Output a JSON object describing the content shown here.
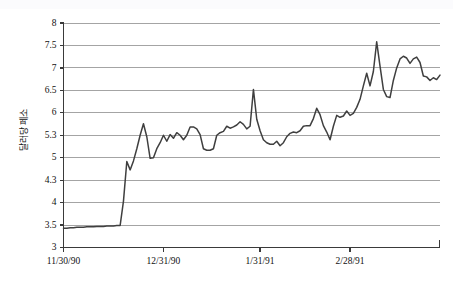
{
  "chart_data": {
    "type": "line",
    "title": "",
    "subtitle": "",
    "xlabel": "",
    "ylabel": "달러당 페소",
    "legend": [],
    "legend_position": "none",
    "grid": true,
    "grid_axis": "y",
    "ylim": [
      3,
      8
    ],
    "ytick_labels": [
      "3",
      "3.5",
      "4",
      "4.3",
      "5",
      "5.3",
      "6",
      "6.5",
      "7",
      "7.5",
      "8"
    ],
    "ytick_values": [
      3,
      3.5,
      4,
      4.3,
      5,
      5.3,
      6,
      6.5,
      7,
      7.5,
      8
    ],
    "xtick_labels": [
      "11/30/90",
      "12/31/90",
      "1/31/91",
      "2/28/91"
    ],
    "xtick_positions": [
      0,
      30,
      59,
      86
    ],
    "xlim": [
      0,
      113
    ],
    "series": [
      {
        "name": "달러당 페소",
        "color": "#3f3f3f",
        "x": [
          0,
          1,
          2,
          3,
          4,
          5,
          6,
          7,
          8,
          9,
          10,
          11,
          12,
          13,
          14,
          15,
          16,
          17,
          18,
          19,
          20,
          21,
          22,
          23,
          24,
          25,
          26,
          27,
          28,
          29,
          30,
          31,
          32,
          33,
          34,
          35,
          36,
          37,
          38,
          39,
          40,
          41,
          42,
          43,
          44,
          45,
          46,
          47,
          48,
          49,
          50,
          51,
          52,
          53,
          54,
          55,
          56,
          57,
          58,
          59,
          60,
          61,
          62,
          63,
          64,
          65,
          66,
          67,
          68,
          69,
          70,
          71,
          72,
          73,
          74,
          75,
          76,
          77,
          78,
          79,
          80,
          81,
          82,
          83,
          84,
          85,
          86,
          87,
          88,
          89,
          90,
          91,
          92,
          93,
          94,
          95,
          96,
          97,
          98,
          99,
          100,
          101,
          102,
          103,
          104,
          105,
          106,
          107,
          108,
          109,
          110,
          111,
          112,
          113
        ],
        "values": [
          3.43,
          3.43,
          3.44,
          3.44,
          3.45,
          3.45,
          3.45,
          3.46,
          3.46,
          3.46,
          3.47,
          3.47,
          3.47,
          3.48,
          3.48,
          3.48,
          3.49,
          3.49,
          4.02,
          4.88,
          4.62,
          4.9,
          5.12,
          5.3,
          5.66,
          5.28,
          4.98,
          5.0,
          5.12,
          5.2,
          5.3,
          5.22,
          5.32,
          5.26,
          5.38,
          5.3,
          5.24,
          5.3,
          5.56,
          5.56,
          5.5,
          5.32,
          5.12,
          5.1,
          5.1,
          5.12,
          5.3,
          5.38,
          5.42,
          5.58,
          5.52,
          5.56,
          5.62,
          5.72,
          5.64,
          5.5,
          5.58,
          6.52,
          5.8,
          5.44,
          5.24,
          5.2,
          5.18,
          5.18,
          5.22,
          5.16,
          5.2,
          5.28,
          5.36,
          5.4,
          5.38,
          5.44,
          5.58,
          5.6,
          5.6,
          5.82,
          6.1,
          5.94,
          5.6,
          5.4,
          5.24,
          5.58,
          5.92,
          5.86,
          5.9,
          6.04,
          5.92,
          5.98,
          6.12,
          6.3,
          6.6,
          6.88,
          6.6,
          6.92,
          7.58,
          7.04,
          6.52,
          6.36,
          6.34,
          6.72,
          7.0,
          7.2,
          7.26,
          7.22,
          7.1,
          7.2,
          7.24,
          7.12,
          6.82,
          6.8,
          6.72,
          6.78,
          6.74,
          6.84
        ]
      }
    ]
  },
  "axes": {
    "y_axis_title": "달러당 페소"
  }
}
